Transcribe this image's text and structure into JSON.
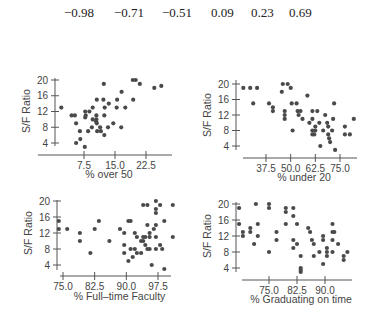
{
  "correlations": [
    "−0.98",
    "−0.71",
    "−0.51",
    "0.09",
    "0.23",
    "0.69"
  ],
  "chart_data": [
    {
      "type": "scatter",
      "title": "",
      "xlabel": "% over 50",
      "ylabel": "S/F Ratio",
      "xticks": [
        "7.5",
        "15.0",
        "22.5"
      ],
      "yticks": [
        "4",
        "8",
        "12",
        "16",
        "20"
      ],
      "xlim": [
        1.5,
        27
      ],
      "ylim": [
        2,
        21
      ],
      "grid": false,
      "points": [
        [
          2.0,
          13
        ],
        [
          4.5,
          11
        ],
        [
          5.3,
          11
        ],
        [
          5.6,
          9
        ],
        [
          5.6,
          4
        ],
        [
          6.5,
          7
        ],
        [
          6.6,
          5
        ],
        [
          7.7,
          3
        ],
        [
          7.8,
          12
        ],
        [
          7.8,
          10.5
        ],
        [
          7.9,
          11
        ],
        [
          8.5,
          7
        ],
        [
          8.8,
          12
        ],
        [
          9.4,
          8
        ],
        [
          9.6,
          13
        ],
        [
          9.6,
          10
        ],
        [
          10.4,
          9.5
        ],
        [
          10.5,
          11
        ],
        [
          10.5,
          10
        ],
        [
          10.6,
          15
        ],
        [
          10.6,
          9
        ],
        [
          10.7,
          7
        ],
        [
          11.4,
          8
        ],
        [
          11.6,
          7
        ],
        [
          12.2,
          15
        ],
        [
          12.3,
          19
        ],
        [
          12.4,
          6
        ],
        [
          12.4,
          11
        ],
        [
          12.5,
          13
        ],
        [
          13.3,
          8
        ],
        [
          13.5,
          14
        ],
        [
          14.6,
          9
        ],
        [
          15.4,
          13
        ],
        [
          15.5,
          15
        ],
        [
          16.5,
          8
        ],
        [
          16.6,
          17
        ],
        [
          17.5,
          13
        ],
        [
          19.3,
          20
        ],
        [
          19.4,
          15
        ],
        [
          20.0,
          20
        ],
        [
          21.0,
          19
        ],
        [
          24.5,
          18
        ],
        [
          26.2,
          18.5
        ]
      ]
    },
    {
      "type": "scatter",
      "title": "",
      "xlabel": "% under 20",
      "ylabel": "S/F Ratio",
      "xticks": [
        "37.5",
        "50.0",
        "62.5",
        "75.0"
      ],
      "yticks": [
        "4",
        "8",
        "12",
        "16",
        "20"
      ],
      "xlim": [
        25,
        83
      ],
      "ylim": [
        2,
        21
      ],
      "grid": false,
      "points": [
        [
          26,
          19
        ],
        [
          29.5,
          19
        ],
        [
          31,
          15
        ],
        [
          33,
          19
        ],
        [
          39,
          15
        ],
        [
          41,
          13
        ],
        [
          41,
          14
        ],
        [
          45.5,
          18
        ],
        [
          46,
          20
        ],
        [
          47,
          12
        ],
        [
          47,
          13
        ],
        [
          47,
          11
        ],
        [
          48.5,
          20
        ],
        [
          50,
          19
        ],
        [
          50.5,
          15
        ],
        [
          51,
          8
        ],
        [
          53,
          15
        ],
        [
          53.5,
          13
        ],
        [
          54,
          12
        ],
        [
          55,
          13
        ],
        [
          56,
          11
        ],
        [
          58.5,
          17
        ],
        [
          59.5,
          10
        ],
        [
          61,
          11
        ],
        [
          61,
          13
        ],
        [
          61,
          7
        ],
        [
          61,
          8
        ],
        [
          62,
          7
        ],
        [
          62.5,
          8
        ],
        [
          62.5,
          9
        ],
        [
          63.5,
          13
        ],
        [
          64.5,
          10
        ],
        [
          65,
          4
        ],
        [
          66.5,
          8
        ],
        [
          67.5,
          12
        ],
        [
          68.5,
          10
        ],
        [
          69,
          7
        ],
        [
          69,
          9
        ],
        [
          69.5,
          6
        ],
        [
          70,
          5
        ],
        [
          71,
          8
        ],
        [
          71.5,
          11
        ],
        [
          72,
          15
        ],
        [
          72.5,
          3
        ],
        [
          77.5,
          9
        ],
        [
          77.5,
          7
        ],
        [
          80,
          7
        ],
        [
          82,
          11
        ]
      ]
    },
    {
      "type": "scatter",
      "title": "",
      "xlabel": "% Full–time Faculty",
      "ylabel": "S/F Ratio",
      "xticks": [
        "75.0",
        "82.5",
        "90.0",
        "97.5"
      ],
      "yticks": [
        "4",
        "8",
        "12",
        "16",
        "20"
      ],
      "xlim": [
        73,
        101
      ],
      "ylim": [
        2,
        21
      ],
      "grid": false,
      "points": [
        [
          74,
          15
        ],
        [
          74,
          13
        ],
        [
          76,
          13
        ],
        [
          79,
          12
        ],
        [
          79,
          10
        ],
        [
          81.5,
          7
        ],
        [
          82.5,
          13
        ],
        [
          83.5,
          15
        ],
        [
          86,
          10
        ],
        [
          88.5,
          13
        ],
        [
          89.5,
          12
        ],
        [
          89.5,
          9
        ],
        [
          89.5,
          7
        ],
        [
          90.5,
          5
        ],
        [
          90.5,
          15
        ],
        [
          91,
          8
        ],
        [
          91,
          15
        ],
        [
          91.5,
          6
        ],
        [
          92,
          12
        ],
        [
          92,
          8
        ],
        [
          92.5,
          7
        ],
        [
          92.5,
          11
        ],
        [
          93.5,
          7
        ],
        [
          93.5,
          10
        ],
        [
          94,
          19
        ],
        [
          94,
          11
        ],
        [
          94,
          10
        ],
        [
          94.5,
          9
        ],
        [
          94.5,
          11
        ],
        [
          95,
          8
        ],
        [
          95,
          14
        ],
        [
          95,
          19
        ],
        [
          95.5,
          11
        ],
        [
          95.5,
          12
        ],
        [
          95.5,
          8
        ],
        [
          96,
          4
        ],
        [
          96.5,
          13
        ],
        [
          97,
          17
        ],
        [
          97,
          18
        ],
        [
          97,
          20
        ],
        [
          97,
          14
        ],
        [
          97,
          11
        ],
        [
          97,
          8
        ],
        [
          98,
          19
        ],
        [
          98,
          9
        ],
        [
          98.5,
          8
        ],
        [
          99,
          3
        ],
        [
          99,
          15
        ],
        [
          101,
          19
        ],
        [
          101,
          11
        ]
      ]
    },
    {
      "type": "scatter",
      "title": "",
      "xlabel": "% Graduating on time",
      "ylabel": "S/F Ratio",
      "xticks": [
        "75.0",
        "82.5",
        "90.0"
      ],
      "yticks": [
        "4",
        "8",
        "12",
        "16",
        "20"
      ],
      "xlim": [
        66,
        96
      ],
      "ylim": [
        2,
        21
      ],
      "grid": false,
      "points": [
        [
          67,
          19
        ],
        [
          67,
          15
        ],
        [
          68,
          13
        ],
        [
          68,
          12
        ],
        [
          70,
          14
        ],
        [
          70,
          13
        ],
        [
          71,
          10
        ],
        [
          71.5,
          20
        ],
        [
          72,
          15
        ],
        [
          72,
          12
        ],
        [
          75,
          8
        ],
        [
          75,
          20
        ],
        [
          75,
          19
        ],
        [
          77,
          13
        ],
        [
          77,
          11
        ],
        [
          79.5,
          19
        ],
        [
          79.5,
          18
        ],
        [
          79.5,
          15
        ],
        [
          81.5,
          19
        ],
        [
          81.5,
          17
        ],
        [
          81.5,
          11
        ],
        [
          81.5,
          9
        ],
        [
          82.5,
          15
        ],
        [
          82.5,
          10
        ],
        [
          83.5,
          7
        ],
        [
          83.5,
          4
        ],
        [
          83.5,
          3.5
        ],
        [
          83.5,
          3
        ],
        [
          85.5,
          14
        ],
        [
          86,
          13
        ],
        [
          86.5,
          11
        ],
        [
          87,
          10
        ],
        [
          87,
          7
        ],
        [
          88.5,
          8
        ],
        [
          89.5,
          12
        ],
        [
          89.5,
          11
        ],
        [
          89.5,
          5
        ],
        [
          90.5,
          9
        ],
        [
          90.5,
          8
        ],
        [
          90.5,
          7
        ],
        [
          92,
          8
        ],
        [
          92,
          11
        ],
        [
          92,
          13
        ],
        [
          92,
          15
        ],
        [
          92.5,
          13
        ],
        [
          93.5,
          10
        ],
        [
          95,
          7
        ],
        [
          95,
          6
        ],
        [
          96,
          8
        ]
      ]
    }
  ]
}
